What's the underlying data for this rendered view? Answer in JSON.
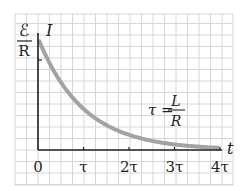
{
  "chart_data": {
    "type": "line",
    "title": "",
    "xlabel": "t",
    "ylabel": "I",
    "y_max_label": {
      "numerator": "ℰ",
      "denominator": "R"
    },
    "x_ticks": [
      "0",
      "τ",
      "2τ",
      "3τ",
      "4τ"
    ],
    "x_tick_values": [
      0,
      1,
      2,
      3,
      4
    ],
    "annotation": {
      "lhs": "τ =",
      "numerator": "L",
      "denominator": "R"
    },
    "xlim": [
      0,
      4
    ],
    "ylim": [
      0,
      1
    ],
    "grid": true,
    "series": [
      {
        "name": "I(t) = (ℰ/R) e^(-t/τ)",
        "x": [
          0,
          0.5,
          1,
          1.5,
          2,
          2.5,
          3,
          3.5,
          4
        ],
        "values": [
          1.0,
          0.607,
          0.368,
          0.223,
          0.135,
          0.082,
          0.05,
          0.03,
          0.018
        ]
      }
    ],
    "colors": {
      "curve": "#a3a3a3",
      "grid": "#d6d6d6",
      "axis": "#231f20",
      "background": "#ffffff"
    }
  }
}
